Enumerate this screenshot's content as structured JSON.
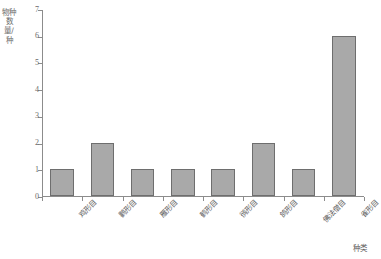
{
  "chart_data": {
    "type": "bar",
    "title": "",
    "subtitle": "",
    "xlabel": "种类",
    "ylabel": "物种数量/种",
    "categories": [
      "鸡形目",
      "鹳形目",
      "雁形目",
      "鹤形目",
      "鸻形目",
      "鸽形目",
      "佛法僧目",
      "雀形目"
    ],
    "values": [
      1,
      2,
      1,
      1,
      1,
      2,
      1,
      6
    ],
    "ylim": [
      0,
      7
    ],
    "yticks": [
      0,
      1,
      2,
      3,
      4,
      5,
      6,
      7
    ],
    "ytick_labels": [
      "0",
      "1",
      "2",
      "3",
      "4",
      "5",
      "6",
      "7"
    ],
    "grid": false,
    "legend": null,
    "bar_color": "#a9a9a9",
    "bar_edge_color": "#6e6e6e",
    "axis_color": "#8c8c8c",
    "text_color": "#5a5a5a",
    "background": "#ffffff"
  }
}
